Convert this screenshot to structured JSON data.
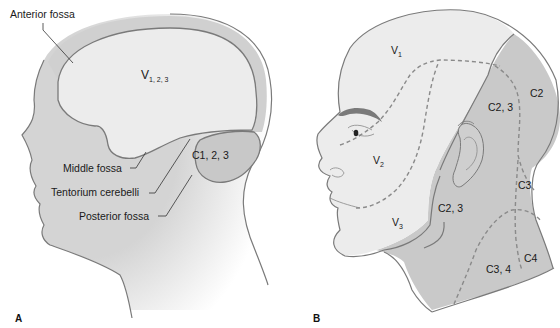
{
  "figure": {
    "panel_a": {
      "label": "A",
      "title": "Sagittal view of head showing cranial fossae innervation",
      "annotations": {
        "anterior_fossa": "Anterior fossa",
        "middle_fossa": "Middle fossa",
        "tentorium": "Tentorium cerebelli",
        "posterior_fossa": "Posterior fossa"
      },
      "regions": {
        "supratentorial": {
          "main": "V",
          "sub": "1, 2, 3"
        },
        "infratentorial": "C1, 2, 3"
      }
    },
    "panel_b": {
      "label": "B",
      "title": "Lateral view of head showing cutaneous dermatomes",
      "regions": {
        "v1": {
          "main": "V",
          "sub": "1"
        },
        "v2": {
          "main": "V",
          "sub": "2"
        },
        "v3": {
          "main": "V",
          "sub": "3"
        },
        "c2": "C2",
        "c23_upper": "C2, 3",
        "c23_lower": "C2, 3",
        "c3": "C3",
        "c34": "C3, 4",
        "c4": "C4"
      }
    },
    "colors": {
      "skin_light": "#ececec",
      "skin_mid": "#d6d6d6",
      "cervical_dark": "#c4c4c4",
      "brain": "#ededed",
      "skull_band": "#d0d0d0",
      "outline": "#7a7a7a",
      "background": "#ffffff"
    }
  }
}
